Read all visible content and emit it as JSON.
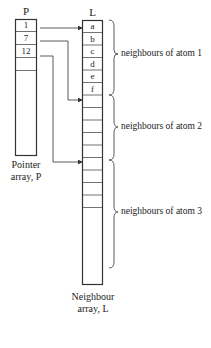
{
  "diagram": {
    "pointer_array": {
      "title": "P",
      "caption_line1": "Pointer",
      "caption_line2": "array, P",
      "values": [
        "1",
        "7",
        "12"
      ]
    },
    "neighbour_array": {
      "title": "L",
      "caption_line1": "Neighbour",
      "caption_line2": "array, L",
      "values": [
        "a",
        "b",
        "c",
        "d",
        "e",
        "f"
      ]
    },
    "groups": [
      {
        "label": "neighbours of atom 1"
      },
      {
        "label": "neighbours of atom 2"
      },
      {
        "label": "neighbours of atom 3"
      }
    ],
    "line_color": "#333333"
  }
}
